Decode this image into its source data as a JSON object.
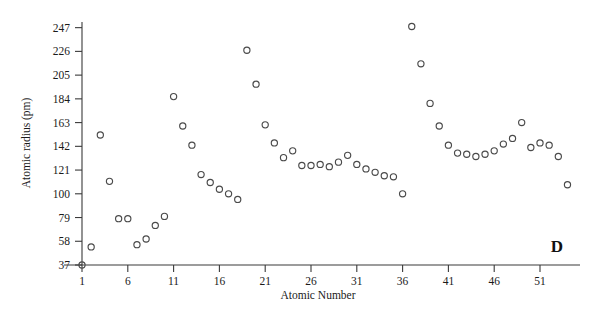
{
  "chart_data": {
    "type": "scatter",
    "title": "",
    "panel_label": "D",
    "xlabel": "Atomic Number",
    "ylabel": "Atomic radius (pm)",
    "xlim": [
      0,
      55
    ],
    "ylim": [
      37,
      252
    ],
    "grid": false,
    "legend": null,
    "xticks": [
      1,
      6,
      11,
      16,
      21,
      26,
      31,
      36,
      41,
      46,
      51
    ],
    "yticks": [
      37,
      58,
      79,
      100,
      121,
      142,
      163,
      184,
      205,
      226,
      247
    ],
    "marker": "open-circle",
    "marker_color": "#4a4a4a",
    "series": [
      {
        "name": "Atomic radius",
        "x": [
          1,
          2,
          3,
          4,
          5,
          6,
          7,
          8,
          9,
          10,
          11,
          12,
          13,
          14,
          15,
          16,
          17,
          18,
          19,
          20,
          21,
          22,
          23,
          24,
          25,
          26,
          27,
          28,
          29,
          30,
          31,
          32,
          33,
          34,
          35,
          36,
          37,
          38,
          39,
          40,
          41,
          42,
          43,
          44,
          45,
          46,
          47,
          48,
          49,
          50,
          51,
          52,
          53,
          54
        ],
        "y": [
          37,
          53,
          152,
          111,
          78,
          78,
          55,
          60,
          72,
          80,
          186,
          160,
          143,
          117,
          110,
          104,
          100,
          95,
          227,
          197,
          161,
          145,
          132,
          138,
          125,
          125,
          126,
          124,
          128,
          134,
          126,
          122,
          119,
          116,
          115,
          100,
          248,
          215,
          180,
          160,
          143,
          136,
          135,
          133,
          135,
          138,
          144,
          149,
          163,
          141,
          145,
          143,
          133,
          108
        ]
      }
    ]
  },
  "axis": {
    "y_title": "Atomic radius (pm)",
    "x_title": "Atomic Number"
  },
  "annotations": {
    "panel_letter": "D"
  }
}
